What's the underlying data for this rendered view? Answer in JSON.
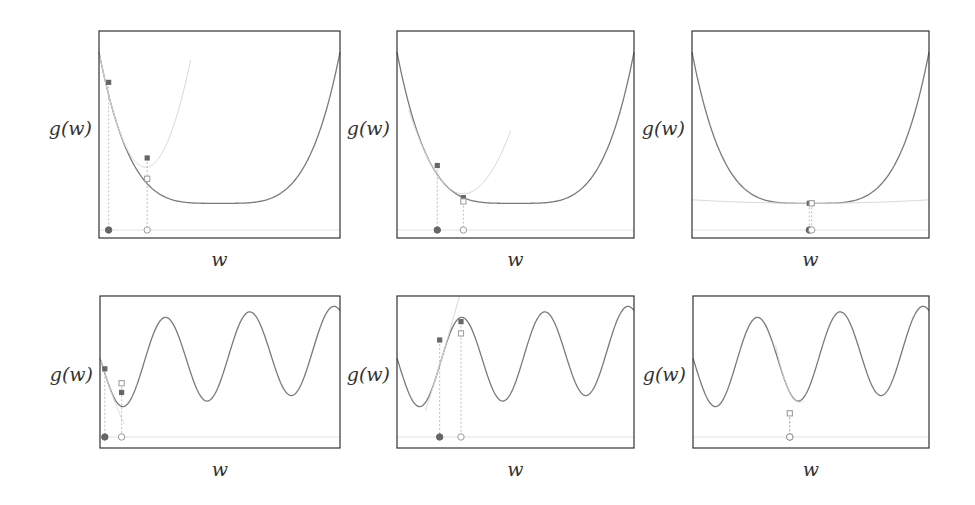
{
  "chart_data": [
    {
      "type": "line",
      "title": "",
      "xlabel": "w",
      "ylabel": "g(w)",
      "function": "quartic bowl",
      "xlim": [
        0,
        1
      ],
      "ylim": [
        0,
        1
      ],
      "grid": false,
      "curve": {
        "name": "g(w)",
        "color": "#7a7a7a"
      },
      "approximation": {
        "name": "second-order approximation",
        "color": "#d8d8d8",
        "center": 0.04,
        "extent": [
          0.0,
          0.38
        ]
      },
      "points": [
        {
          "w": 0.04,
          "g": 0.76,
          "on_curve": 0.76,
          "marker": "filled",
          "label": "start"
        },
        {
          "w": 0.2,
          "g": 0.36,
          "on_curve": 0.25,
          "marker": "hollow",
          "label": "next"
        }
      ]
    },
    {
      "type": "line",
      "title": "",
      "xlabel": "w",
      "ylabel": "g(w)",
      "function": "quartic bowl",
      "xlim": [
        0,
        1
      ],
      "ylim": [
        0,
        1
      ],
      "grid": false,
      "curve": {
        "name": "g(w)",
        "color": "#7a7a7a"
      },
      "approximation": {
        "name": "second-order approximation",
        "color": "#d8d8d8",
        "center": 0.17,
        "extent": [
          0.05,
          0.48
        ]
      },
      "points": [
        {
          "w": 0.17,
          "g": 0.32,
          "on_curve": 0.32,
          "marker": "filled",
          "label": "start"
        },
        {
          "w": 0.28,
          "g": 0.15,
          "on_curve": 0.13,
          "marker": "hollow",
          "label": "next"
        }
      ]
    },
    {
      "type": "line",
      "title": "",
      "xlabel": "w",
      "ylabel": "g(w)",
      "function": "quartic bowl",
      "xlim": [
        0,
        1
      ],
      "ylim": [
        0,
        1
      ],
      "grid": false,
      "curve": {
        "name": "g(w)",
        "color": "#7a7a7a"
      },
      "approximation": {
        "name": "second-order approximation",
        "color": "#e8e8e8",
        "center": 0.5,
        "extent": [
          0.0,
          1.0
        ]
      },
      "points": [
        {
          "w": 0.495,
          "g": 0.12,
          "on_curve": 0.12,
          "marker": "filled",
          "label": "start"
        },
        {
          "w": 0.505,
          "g": 0.12,
          "on_curve": 0.12,
          "marker": "hollow",
          "label": "next"
        }
      ]
    },
    {
      "type": "line",
      "title": "",
      "xlabel": "w",
      "ylabel": "g(w)",
      "function": "sinusoid plus linear",
      "xlim": [
        0,
        1
      ],
      "ylim": [
        0,
        1
      ],
      "grid": false,
      "curve": {
        "name": "g(w)",
        "color": "#7a7a7a"
      },
      "approximation": {
        "name": "second-order approximation",
        "color": "#dddddd",
        "center": 0.02,
        "extent": [
          0.0,
          0.1
        ]
      },
      "points": [
        {
          "w": 0.02,
          "g": 0.49,
          "on_curve": 0.49,
          "marker": "filled",
          "label": "start"
        },
        {
          "w": 0.09,
          "g": 0.31,
          "on_curve": 0.38,
          "marker": "hollow",
          "label": "next"
        }
      ]
    },
    {
      "type": "line",
      "title": "",
      "xlabel": "w",
      "ylabel": "g(w)",
      "function": "sinusoid plus linear",
      "xlim": [
        0,
        1
      ],
      "ylim": [
        0,
        1
      ],
      "grid": false,
      "curve": {
        "name": "g(w)",
        "color": "#7a7a7a"
      },
      "approximation": {
        "name": "second-order approximation",
        "color": "#dddddd",
        "center": 0.18,
        "extent": [
          0.12,
          0.4
        ]
      },
      "points": [
        {
          "w": 0.18,
          "g": 0.71,
          "on_curve": 0.66,
          "marker": "filled",
          "label": "start"
        },
        {
          "w": 0.27,
          "g": 0.85,
          "on_curve": 0.76,
          "marker": "hollow",
          "label": "next"
        }
      ]
    },
    {
      "type": "line",
      "title": "",
      "xlabel": "w",
      "ylabel": "g(w)",
      "function": "sinusoid plus linear",
      "xlim": [
        0,
        1
      ],
      "ylim": [
        0,
        1
      ],
      "grid": false,
      "curve": {
        "name": "g(w)",
        "color": "#7a7a7a"
      },
      "approximation": {
        "name": "second-order approximation",
        "color": "#dddddd",
        "center": 0.41,
        "extent": [
          0.35,
          0.47
        ]
      },
      "points": [
        {
          "w": 0.41,
          "g": 0.15,
          "on_curve": 0.15,
          "marker": "filled",
          "label": "start"
        },
        {
          "w": 0.41,
          "g": 0.15,
          "on_curve": 0.15,
          "marker": "hollow",
          "label": "next"
        }
      ]
    }
  ],
  "colors": {
    "frame": "#333333",
    "curve": "#7a7a7a",
    "filled_marker": "#666666",
    "hollow_marker": "#999999",
    "baseline": "#e3e3e3"
  }
}
